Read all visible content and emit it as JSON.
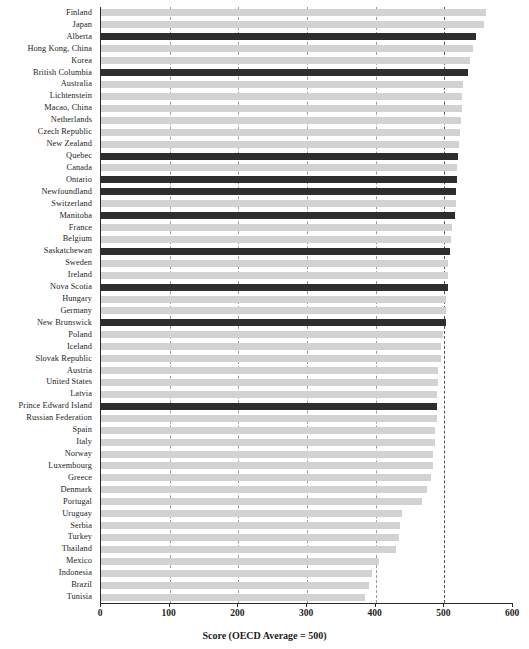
{
  "chart_data": {
    "type": "bar",
    "orientation": "horizontal",
    "title": "",
    "xlabel": "Score (OECD Average = 500)",
    "ylabel": "",
    "xlim": [
      0,
      600
    ],
    "ylim": null,
    "grid": true,
    "gridlines_x": [
      100,
      200,
      300,
      400,
      500
    ],
    "legend": null,
    "xticks": [
      0,
      100,
      200,
      300,
      400,
      500,
      600
    ],
    "xtick_labels": [
      "0",
      "100",
      "200",
      "300",
      "400",
      "500",
      "600"
    ],
    "highlight_color": "#2e2e2e",
    "base_color": "#d2d2d2",
    "highlight_note": "Canadian provinces shown in dark",
    "categories": [
      "Finland",
      "Japan",
      "Alberta",
      "Hong Kong, China",
      "Korea",
      "British Columbia",
      "Australia",
      "Lichtenstein",
      "Macao, China",
      "Netherlands",
      "Czech Republic",
      "New Zealand",
      "Quebec",
      "Canada",
      "Ontario",
      "Newfoundland",
      "Switzerland",
      "Manitoba",
      "France",
      "Belgium",
      "Saskatchewan",
      "Sweden",
      "Ireland",
      "Nova Scotia",
      "Hungary",
      "Germany",
      "New Brunswick",
      "Poland",
      "Iceland",
      "Slovak Republic",
      "Austria",
      "United States",
      "Latvia",
      "Prince Edward Island",
      "Russian Federation",
      "Spain",
      "Italy",
      "Norway",
      "Luxembourg",
      "Greece",
      "Denmark",
      "Portugal",
      "Uruguay",
      "Serbia",
      "Turkey",
      "Thailand",
      "Mexico",
      "Indonesia",
      "Brazil",
      "Tunisia"
    ],
    "values": [
      560,
      558,
      546,
      542,
      538,
      534,
      527,
      525,
      525,
      524,
      523,
      521,
      520,
      519,
      518,
      517,
      517,
      516,
      511,
      509,
      508,
      506,
      506,
      505,
      503,
      502,
      502,
      498,
      495,
      495,
      491,
      491,
      489,
      489,
      489,
      487,
      486,
      484,
      483,
      481,
      475,
      468,
      438,
      436,
      434,
      429,
      405,
      395,
      390,
      385
    ],
    "highlighted": [
      "Alberta",
      "British Columbia",
      "Quebec",
      "Ontario",
      "Newfoundland",
      "Manitoba",
      "Saskatchewan",
      "Nova Scotia",
      "New Brunswick",
      "Prince Edward Island"
    ]
  }
}
